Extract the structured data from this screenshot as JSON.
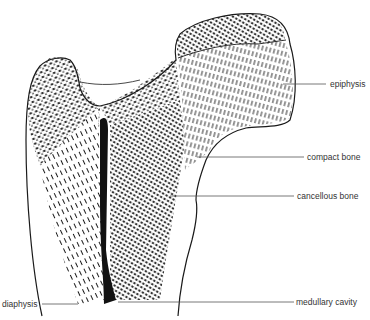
{
  "diagram": {
    "colors": {
      "ink": "#1a1a1a",
      "leader": "#555555",
      "background": "#ffffff"
    },
    "labels": [
      {
        "id": "epiphysis",
        "text": "epiphysis"
      },
      {
        "id": "compact-bone",
        "text": "compact bone"
      },
      {
        "id": "cancellous-bone",
        "text": "cancellous bone"
      },
      {
        "id": "medullary-cavity",
        "text": "medullary cavity"
      },
      {
        "id": "diaphysis",
        "text": "diaphysis"
      }
    ]
  }
}
